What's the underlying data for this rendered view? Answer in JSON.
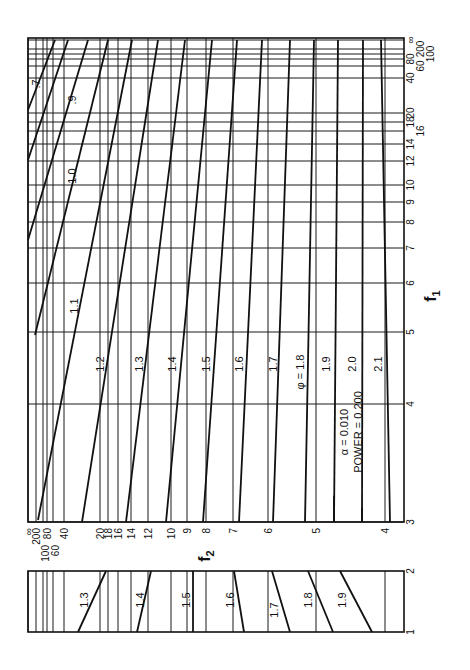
{
  "chart_data": {
    "type": "line",
    "parameters": {
      "alpha": "0.010",
      "power": "0.200",
      "alpha_label": "α = 0.010",
      "power_label": "POWER = 0.200"
    },
    "xlabel": "f2",
    "ylabel": "f1",
    "f2_ticks": [
      "∞",
      "200",
      "100",
      "80",
      "60",
      "40",
      "20",
      "18",
      "16",
      "14",
      "12",
      "10",
      "9",
      "8",
      "7",
      "6",
      "5",
      "4"
    ],
    "f2_tick_x": [
      28,
      36,
      43,
      47,
      53,
      64,
      100,
      108,
      118,
      131,
      148,
      171,
      187,
      206,
      233,
      268,
      316,
      385
    ],
    "f1_ticks_main": [
      "3",
      "4",
      "5",
      "6",
      "7",
      "8",
      "9",
      "10",
      "12",
      "14",
      "16",
      "18",
      "20",
      "40",
      "60",
      "80",
      "100",
      "200",
      "∞"
    ],
    "f1_tick_y": [
      522,
      404,
      332,
      283,
      248,
      222,
      202,
      185,
      161,
      144,
      131,
      122,
      113,
      78,
      66,
      59,
      54,
      49,
      40
    ],
    "f1_ticks_inset": [
      "1",
      "2"
    ],
    "grid": true,
    "main_panel_curves": [
      {
        "phi": "0.7",
        "label": ".7",
        "points": [
          [
            28,
            110
          ],
          [
            55,
            40
          ]
        ]
      },
      {
        "phi": "0.8",
        "label": "",
        "points": [
          [
            28,
            160
          ],
          [
            68,
            40
          ]
        ]
      },
      {
        "phi": "0.9",
        "label": ".9",
        "points": [
          [
            28,
            240
          ],
          [
            88,
            40
          ]
        ]
      },
      {
        "phi": "1.0",
        "label": "1.0",
        "points": [
          [
            35,
            335
          ],
          [
            108,
            40
          ]
        ]
      },
      {
        "phi": "1.1",
        "label": "1.1",
        "points": [
          [
            38,
            520
          ],
          [
            132,
            40
          ]
        ]
      },
      {
        "phi": "1.2",
        "label": "1.2",
        "points": [
          [
            82,
            522
          ],
          [
            158,
            40
          ]
        ]
      },
      {
        "phi": "1.3",
        "label": "1.3",
        "points": [
          [
            126,
            522
          ],
          [
            185,
            40
          ]
        ]
      },
      {
        "phi": "1.4",
        "label": "1.4",
        "points": [
          [
            166,
            522
          ],
          [
            212,
            40
          ]
        ]
      },
      {
        "phi": "1.5",
        "label": "1.5",
        "points": [
          [
            203,
            522
          ],
          [
            237,
            40
          ]
        ]
      },
      {
        "phi": "1.6",
        "label": "1.6",
        "points": [
          [
            239,
            522
          ],
          [
            262,
            40
          ]
        ]
      },
      {
        "phi": "1.7",
        "label": "1.7",
        "points": [
          [
            273,
            522
          ],
          [
            290,
            40
          ]
        ]
      },
      {
        "phi": "1.8",
        "label": "φ = 1.8",
        "points": [
          [
            305,
            522
          ],
          [
            314,
            40
          ]
        ]
      },
      {
        "phi": "1.9",
        "label": "1.9",
        "points": [
          [
            334,
            522
          ],
          [
            338,
            40
          ]
        ]
      },
      {
        "phi": "2.0",
        "label": "2.0",
        "points": [
          [
            362,
            522
          ],
          [
            363,
            40
          ]
        ]
      },
      {
        "phi": "2.1",
        "label": "2.1",
        "points": [
          [
            390,
            522
          ],
          [
            381,
            40
          ]
        ]
      }
    ],
    "inset_panel_curves": [
      {
        "phi": "1.3",
        "label": "1.3",
        "points": [
          [
            78,
            632
          ],
          [
            106,
            571
          ]
        ]
      },
      {
        "phi": "1.4",
        "label": "1.4",
        "points": [
          [
            137,
            632
          ],
          [
            151,
            571
          ]
        ]
      },
      {
        "phi": "1.5",
        "label": "1.5",
        "points": [
          [
            193,
            632
          ],
          [
            193,
            571
          ]
        ]
      },
      {
        "phi": "1.6",
        "label": "1.6",
        "points": [
          [
            244,
            632
          ],
          [
            234,
            571
          ]
        ]
      },
      {
        "phi": "1.7",
        "label": "1.7",
        "points": [
          [
            290,
            632
          ],
          [
            272,
            571
          ]
        ]
      },
      {
        "phi": "1.8",
        "label": "1.8",
        "points": [
          [
            333,
            632
          ],
          [
            308,
            571
          ]
        ]
      },
      {
        "phi": "1.9",
        "label": "1.9",
        "points": [
          [
            372,
            632
          ],
          [
            340,
            571
          ]
        ]
      }
    ],
    "legend_position": "inside lower-right (text rotated)"
  },
  "labels": {
    "f1": "f",
    "f1_sub": "1",
    "f2": "f",
    "f2_sub": "2",
    "alpha": "α  =  0.010",
    "power": "POWER = 0.200"
  }
}
